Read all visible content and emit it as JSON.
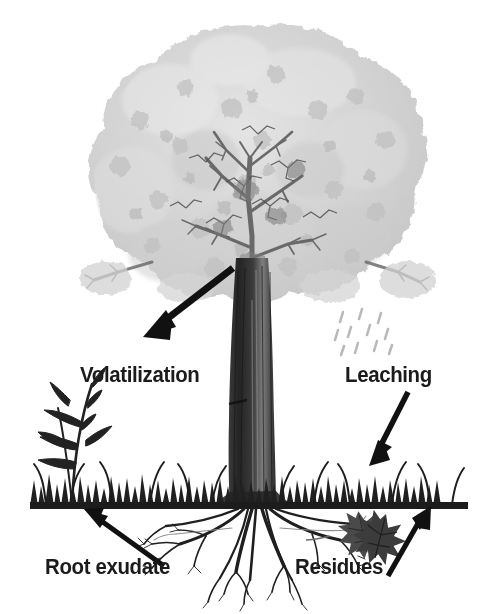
{
  "figure": {
    "background_color": "#ffffff",
    "width": 497,
    "height": 614
  },
  "labels": {
    "volatilization": "Volatilization",
    "leaching": "Leaching",
    "root_exudate": "Root exudate",
    "residues": "Residues"
  },
  "colors": {
    "ink": "#1b1b1b",
    "canopy_light": "#d7d7d7",
    "canopy_mid": "#c2c2c2",
    "canopy_dark": "#9a9a9a",
    "branch": "#4a4a4a",
    "trunk_dark": "#2e2e2e",
    "trunk_mid": "#5c5c5c",
    "trunk_light": "#8c8c8c",
    "grass": "#242424",
    "ground_line": "#1c1c1c",
    "root": "#1f1f1f",
    "leaf_litter": "#555555",
    "rain": "#bdbdbd",
    "arrow": "#111111"
  },
  "elements": {
    "canopy": {
      "name": "tree-canopy",
      "cx": 258,
      "cy": 175,
      "rx": 163,
      "ry": 150
    },
    "trunk": {
      "name": "tree-trunk",
      "top_y": 270,
      "bottom_y": 508,
      "top_width": 38,
      "bottom_width": 46,
      "center_x": 252
    },
    "ground_line": {
      "name": "soil-surface-line",
      "x1": 30,
      "x2": 468,
      "y": 505,
      "thickness": 7
    },
    "grass_band": {
      "name": "grass-band",
      "y_top": 462,
      "y_bottom": 505
    },
    "tall_plant": {
      "name": "tall-grass-plant",
      "x": 65,
      "y_top": 375,
      "y_bottom": 503
    },
    "roots": {
      "name": "root-system",
      "origin_x": 258,
      "origin_y": 508,
      "spread_left": 150,
      "spread_right": 180,
      "depth": 95
    },
    "leaf_litter": {
      "name": "leaf-residues",
      "x": 352,
      "y": 520,
      "count": 2
    },
    "rain": {
      "name": "rain-droplets",
      "x_start": 336,
      "x_end": 392,
      "y_start": 308,
      "y_end": 352,
      "count": 11
    }
  },
  "arrows": [
    {
      "name": "arrow-volatilization",
      "from_x": 232,
      "from_y": 270,
      "to_x": 147,
      "to_y": 336,
      "direction": "down-left"
    },
    {
      "name": "arrow-leaching",
      "from_x": 407,
      "from_y": 392,
      "to_x": 371,
      "to_y": 462,
      "direction": "down-left"
    },
    {
      "name": "arrow-root-exudate",
      "from_x": 163,
      "from_y": 566,
      "to_x": 86,
      "to_y": 511,
      "direction": "up-left"
    },
    {
      "name": "arrow-residues",
      "from_x": 389,
      "from_y": 574,
      "to_x": 430,
      "to_y": 508,
      "direction": "up-right"
    }
  ]
}
